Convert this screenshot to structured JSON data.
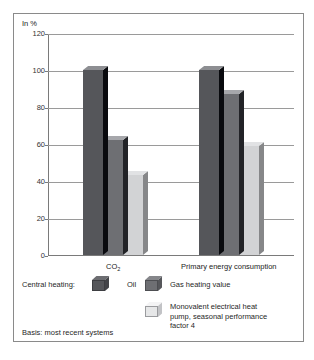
{
  "figure": {
    "y_axis_unit_label": "In %",
    "basis_note": "Basis: most recent systems"
  },
  "legend": {
    "heading": "Central heating:",
    "entries": [
      {
        "label": "Oil",
        "swatch": "dark-gray-cube-icon",
        "color": "#55565a"
      },
      {
        "label": "Gas heating value",
        "swatch": "medium-gray-cube-icon",
        "color": "#6e6f73"
      },
      {
        "label": "Monovalent electrical heat\npump, seasonal performance\nfactor 4",
        "swatch": "light-gray-cube-icon",
        "color": "#d2d3d5"
      }
    ]
  },
  "chart_data": {
    "type": "bar",
    "title": "",
    "subtitle": "",
    "xlabel": "",
    "ylabel": "In %",
    "ylim": [
      0,
      120
    ],
    "yticks": [
      0,
      20,
      40,
      60,
      80,
      100,
      120
    ],
    "ytick_labels": [
      "0",
      "20",
      "40",
      "60",
      "80",
      "100",
      "120"
    ],
    "grid": true,
    "grid_axis": "y",
    "legend_position": "below-plot",
    "categories": [
      "CO2",
      "Primary energy consumption"
    ],
    "category_labels_display": [
      "CO₂",
      "Primary energy consumption"
    ],
    "series": [
      {
        "name": "Oil",
        "color": "#55565a",
        "values": [
          100,
          100
        ]
      },
      {
        "name": "Gas heating value",
        "color": "#6e6f73",
        "values": [
          62,
          87
        ]
      },
      {
        "name": "Monovalent electrical heat pump, seasonal performance factor 4",
        "color": "#d2d3d5",
        "values": [
          43,
          59
        ]
      }
    ]
  }
}
